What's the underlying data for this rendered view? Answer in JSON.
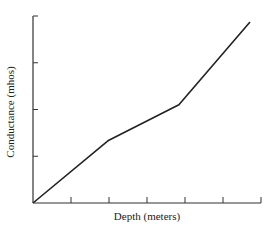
{
  "chart_data": {
    "type": "line",
    "title": "",
    "xlabel": "Depth (meters)",
    "ylabel": "Conductance (mhos)",
    "x_ticks": 6,
    "y_ticks": 4,
    "xlim": [
      0,
      6
    ],
    "ylim": [
      0,
      4
    ],
    "tick_labels_shown": false,
    "grid": false,
    "legend": null,
    "series": [
      {
        "name": "Conductance",
        "color": "#222222",
        "points": [
          {
            "x": 0.0,
            "y": 0.0
          },
          {
            "x": 1.97,
            "y": 1.33
          },
          {
            "x": 3.84,
            "y": 2.1
          },
          {
            "x": 5.71,
            "y": 3.87
          }
        ]
      }
    ]
  },
  "style": {
    "axis_color": "#333333",
    "line_color": "#222222"
  }
}
